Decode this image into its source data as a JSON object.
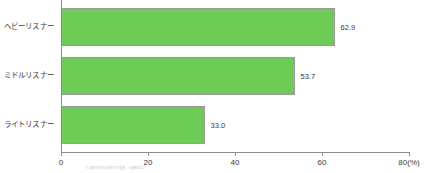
{
  "chart_data": {
    "type": "bar",
    "orientation": "horizontal",
    "title": "",
    "xlabel": "",
    "ylabel": "",
    "categories": [
      "ヘビーリスナー",
      "ミドルリスナー",
      "ライトリスナー"
    ],
    "values": [
      62.9,
      53.7,
      33.0
    ],
    "value_labels": [
      "62.9",
      "53.7",
      "33.0"
    ],
    "xlim": [
      0,
      80
    ],
    "xticks": [
      0,
      20,
      40,
      60,
      80
    ],
    "xtick_labels": [
      "0",
      "20",
      "40",
      "60",
      "80(%)"
    ],
    "unit": "%",
    "grid": false,
    "legend": false,
    "bar_color": "#6ecb56",
    "bar_border_color": "#9a9a9a",
    "axis_color": "#8c8c8c"
  },
  "footnote": {
    "text": "※調査対象別の聞き方の差異　※複数回答"
  }
}
